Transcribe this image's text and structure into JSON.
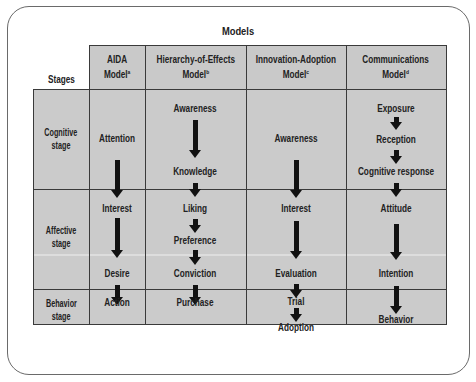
{
  "title": "Models",
  "stages_header": "Stages",
  "models": [
    {
      "name": "AIDA Model",
      "line1": "AIDA",
      "line2": "Model",
      "sup": "a"
    },
    {
      "name": "Hierarchy-of-Effects Model",
      "line1": "Hierarchy-of-Effects",
      "line2": "Model",
      "sup": "b"
    },
    {
      "name": "Innovation-Adoption Model",
      "line1": "Innovation-Adoption",
      "line2": "Model",
      "sup": "c"
    },
    {
      "name": "Communications Model",
      "line1": "Communications",
      "line2": "Model",
      "sup": "d"
    }
  ],
  "stages": [
    {
      "line1": "Cognitive",
      "line2": "stage"
    },
    {
      "line1": "Affective",
      "line2": "stage"
    },
    {
      "line1": "Behavior",
      "line2": "stage"
    }
  ],
  "aida": [
    "Attention",
    "Interest",
    "Desire",
    "Action"
  ],
  "hierarchy": [
    "Awareness",
    "Knowledge",
    "Liking",
    "Preference",
    "Conviction",
    "Purchase"
  ],
  "innovation": [
    "Awareness",
    "Interest",
    "Evaluation",
    "Trial",
    "Adoption"
  ],
  "communications": [
    "Exposure",
    "Reception",
    "Cognitive response",
    "Attitude",
    "Intention",
    "Behavior"
  ],
  "colors": {
    "cell_fill": "#c9c9c9",
    "grid_line": "#3a3a3a",
    "arrow": "#111111",
    "frame": "#6a6a6a"
  }
}
